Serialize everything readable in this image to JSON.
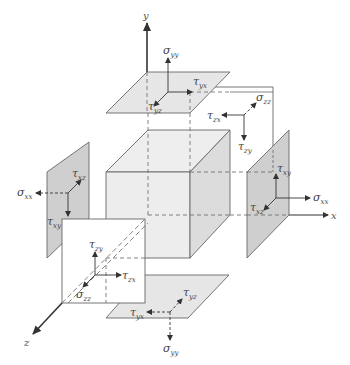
{
  "diagram": {
    "colors": {
      "line": "#555555",
      "axis": "#333333",
      "cube_fill": "#ededed",
      "cube_side_fill": "#dcdcdc",
      "plane_face_fill": "#e6e6e6",
      "plane_side_fill": "#cfcfcf",
      "plane_white": "#ffffff"
    },
    "axes": {
      "x": {
        "label": "x"
      },
      "y": {
        "label": "y"
      },
      "z": {
        "label": "z"
      }
    },
    "faces": {
      "top_y": {
        "normal": {
          "sym": "σ",
          "sub": "yy"
        },
        "shear1": {
          "sym": "τ",
          "sub": "yx"
        },
        "shear2": {
          "sym": "τ",
          "sub": "yz"
        }
      },
      "bottom_y": {
        "normal": {
          "sym": "σ",
          "sub": "yy"
        },
        "shear1": {
          "sym": "τ",
          "sub": "yx"
        },
        "shear2": {
          "sym": "τ",
          "sub": "yz"
        }
      },
      "right_x": {
        "normal": {
          "sym": "σ",
          "sub": "xx"
        },
        "shear1": {
          "sym": "τ",
          "sub": "xy"
        },
        "shear2": {
          "sym": "τ",
          "sub": "xz"
        }
      },
      "left_x": {
        "normal": {
          "sym": "σ",
          "sub": "xx"
        },
        "shear1": {
          "sym": "τ",
          "sub": "xy"
        },
        "shear2": {
          "sym": "τ",
          "sub": "xz"
        }
      },
      "front_z": {
        "normal": {
          "sym": "σ",
          "sub": "zz"
        },
        "shear1": {
          "sym": "τ",
          "sub": "zx"
        },
        "shear2": {
          "sym": "τ",
          "sub": "zy"
        }
      },
      "back_z": {
        "normal": {
          "sym": "σ",
          "sub": "zz"
        },
        "shear1": {
          "sym": "τ",
          "sub": "zx"
        },
        "shear2": {
          "sym": "τ",
          "sub": "zy"
        }
      }
    }
  }
}
